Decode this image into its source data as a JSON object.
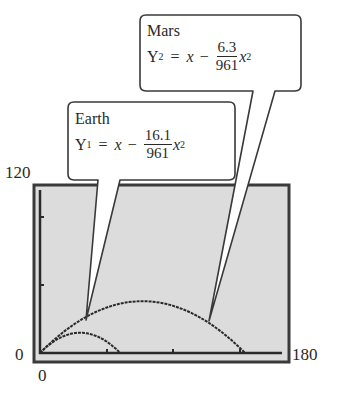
{
  "axes": {
    "y_max_label": "120",
    "y_min_label": "0",
    "x_min_label": "0",
    "x_max_label": "180"
  },
  "callouts": {
    "mars": {
      "title": "Mars",
      "var": "Y",
      "sub": "2",
      "equals": "=",
      "x": "x",
      "minus": "−",
      "numerator": "6.3",
      "denominator": "961",
      "tail_var": "x",
      "power": "2"
    },
    "earth": {
      "title": "Earth",
      "var": "Y",
      "sub": "1",
      "equals": "=",
      "x": "x",
      "minus": "−",
      "numerator": "16.1",
      "denominator": "961",
      "tail_var": "x",
      "power": "2"
    }
  },
  "colors": {
    "screen_bg": "#dcdcdc",
    "frame": "#3a3a3a",
    "curve": "#2a2a2a"
  },
  "chart_data": {
    "type": "line",
    "title": "",
    "xlabel": "",
    "ylabel": "",
    "xlim": [
      0,
      180
    ],
    "ylim": [
      0,
      120
    ],
    "x_ticks": [
      0,
      30,
      60,
      90,
      120,
      150,
      180
    ],
    "y_ticks": [
      0,
      30,
      60,
      90,
      120
    ],
    "grid": false,
    "series": [
      {
        "name": "Earth: Y1 = x - (16.1/961)x^2",
        "x": [
          0,
          10,
          20,
          29.8,
          40,
          50,
          59.7
        ],
        "values": [
          0,
          8.3,
          13.3,
          14.9,
          13.2,
          8.1,
          0
        ]
      },
      {
        "name": "Mars: Y2 = x - (6.3/961)x^2",
        "x": [
          0,
          20,
          40,
          60,
          76.3,
          100,
          120,
          140,
          152.5
        ],
        "values": [
          0,
          17.4,
          29.5,
          36.4,
          38.1,
          34.4,
          25.6,
          11.5,
          0
        ]
      }
    ]
  }
}
